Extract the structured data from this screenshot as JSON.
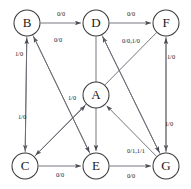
{
  "diagram": {
    "type": "state-transition-graph",
    "background_color": "#ffffff",
    "node_stroke_color": "#3b3b3b",
    "edge_color": "#6e6e78",
    "text_color": "#1a1a1a",
    "node_radius": 13,
    "nodes": [
      {
        "id": "B",
        "label": "B",
        "cx": 27,
        "cy": 23
      },
      {
        "id": "D",
        "label": "D",
        "cx": 96,
        "cy": 23
      },
      {
        "id": "F",
        "label": "F",
        "cx": 166,
        "cy": 23
      },
      {
        "id": "A",
        "label": "A",
        "cx": 96,
        "cy": 95
      },
      {
        "id": "C",
        "label": "C",
        "cx": 25,
        "cy": 166
      },
      {
        "id": "E",
        "label": "E",
        "cx": 96,
        "cy": 166
      },
      {
        "id": "G",
        "label": "G",
        "cx": 166,
        "cy": 166
      }
    ],
    "edges": [
      {
        "id": "B-D",
        "from": "B",
        "to": "D",
        "label": "0/0",
        "lx": 61,
        "ly": 15
      },
      {
        "id": "D-F",
        "from": "D",
        "to": "F",
        "label": "0/0",
        "lx": 131,
        "ly": 15
      },
      {
        "id": "C-E",
        "from": "C",
        "to": "E",
        "label": "0/0",
        "lx": 60,
        "ly": 176
      },
      {
        "id": "E-G",
        "from": "E",
        "to": "G",
        "label": "0/0",
        "lx": 131,
        "ly": 177
      },
      {
        "id": "E-B",
        "from": "E",
        "to": "B",
        "label": "0/0",
        "lx": 58,
        "ly": 41
      },
      {
        "id": "G-D",
        "from": "G",
        "to": "D",
        "label": "0/0,1/0",
        "lx": 131,
        "ly": 42
      },
      {
        "id": "B-C",
        "from": "B",
        "to": "C",
        "label": "1/0",
        "lx": 19,
        "ly": 55
      },
      {
        "id": "C-B",
        "from": "C",
        "to": "B",
        "label": "1/0",
        "lx": 22,
        "ly": 118
      },
      {
        "id": "F-G",
        "from": "F",
        "to": "G",
        "label": "1/0",
        "lx": 171,
        "ly": 58
      },
      {
        "id": "G-F",
        "from": "G",
        "to": "F",
        "label": "1/0",
        "lx": 169,
        "ly": 125
      },
      {
        "id": "C-A",
        "from": "C",
        "to": "A",
        "label": "1/0",
        "lx": 72,
        "ly": 99
      },
      {
        "id": "D-G",
        "from": "D",
        "to": "G",
        "label": "0/1,1/1",
        "lx": 136,
        "ly": 152
      },
      {
        "id": "B-E",
        "from": "B",
        "to": "E",
        "label": "",
        "lx": 0,
        "ly": 0
      },
      {
        "id": "F-C",
        "from": "F",
        "to": "C",
        "label": "",
        "lx": 0,
        "ly": 0
      },
      {
        "id": "G-A",
        "from": "G",
        "to": "A",
        "label": "",
        "lx": 0,
        "ly": 0
      },
      {
        "id": "D-E",
        "from": "D",
        "to": "E",
        "label": "",
        "lx": 0,
        "ly": 0
      }
    ]
  }
}
